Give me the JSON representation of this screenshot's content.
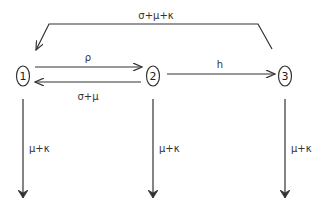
{
  "diagram": {
    "type": "compartment-flow",
    "nodes": [
      {
        "id": "1",
        "label": "1"
      },
      {
        "id": "2",
        "label": "2"
      },
      {
        "id": "3",
        "label": "3"
      }
    ],
    "edges": [
      {
        "from": "3",
        "to": "1",
        "label": "σ+μ+κ"
      },
      {
        "from": "1",
        "to": "2",
        "label": "ρ"
      },
      {
        "from": "2",
        "to": "1",
        "label": "σ+μ"
      },
      {
        "from": "2",
        "to": "3",
        "label": "h"
      },
      {
        "from": "1",
        "to": "out",
        "label": "μ+κ"
      },
      {
        "from": "2",
        "to": "out",
        "label": "μ+κ"
      },
      {
        "from": "3",
        "to": "out",
        "label": "μ+κ"
      }
    ],
    "colors": {
      "stroke": "#333333",
      "text": "#333333",
      "background": "#ffffff"
    }
  }
}
